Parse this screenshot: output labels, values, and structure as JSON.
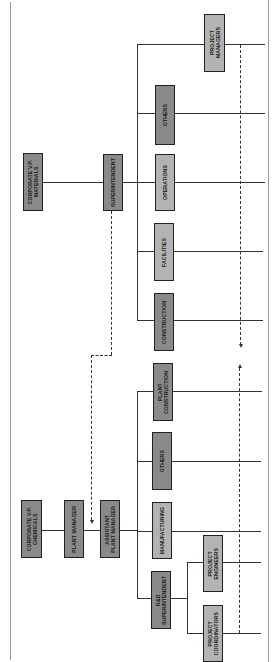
{
  "figure": {
    "caption_hint": "",
    "orientation": "rotated 90° counter-clockwise"
  },
  "colors": {
    "primary_box": "#8a8a8a",
    "secondary_box": "#b3b3b3",
    "line": "#333333",
    "frame": "#9a9a9a"
  },
  "materials_division": {
    "head": "CORPORATE V.P.\nMATERIALS",
    "superintendent": "SUPERINTENDENT",
    "departments": [
      {
        "label": "PROJECT\nMANAGERS"
      },
      {
        "label": "OTHERS"
      },
      {
        "label": "OPERATIONS"
      },
      {
        "label": "FACILITIES"
      },
      {
        "label": "CONSTRUCTION"
      }
    ]
  },
  "chemicals_division": {
    "head": "CORPORATE V.P.\nCHEMICALS",
    "plant_manager": "PLANT MANAGER",
    "assistant_plant_manager": "ASSISTANT\nPLANT MANAGER",
    "departments": [
      {
        "label": "PLANT\nCONSTRUCTION"
      },
      {
        "label": "OTHERS"
      },
      {
        "label": "MANUFACTURING"
      },
      {
        "label": "R&D\nSUPERINTENDENT"
      }
    ],
    "rd_reports": [
      {
        "label": "PROJECT\nENGINEERS"
      },
      {
        "label": "PROJECT\nCOORDINATORS"
      }
    ]
  },
  "links": [
    {
      "from": "SUPERINTENDENT",
      "to": "PLANT MANAGER",
      "style": "dashed"
    },
    {
      "from": "PROJECT MANAGERS",
      "to": "PROJECT COORDINATORS",
      "style": "dashed",
      "bidirectional": true
    }
  ]
}
